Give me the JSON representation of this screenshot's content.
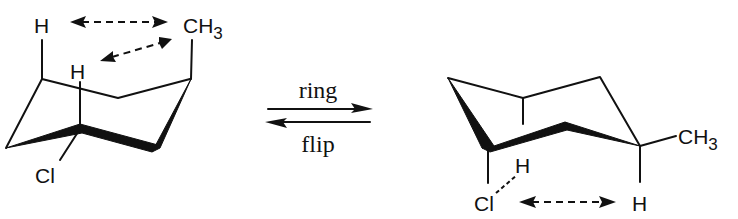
{
  "diagram": {
    "type": "chair-conformation-ring-flip",
    "left_chair": {
      "labels": {
        "h_top": "H",
        "h_axial": "H",
        "methyl": "CH",
        "methyl_sub": "3",
        "chloro": "Cl"
      },
      "interactions": [
        "H ↔ CH3 (1,3-diaxial)",
        "H ↔ CH3 (1,3-diaxial)"
      ]
    },
    "equilibrium": {
      "label_top": "ring",
      "label_bottom": "flip"
    },
    "right_chair": {
      "labels": {
        "methyl": "CH",
        "methyl_sub": "3",
        "chloro": "Cl",
        "h_near_cl": "H",
        "h_axial": "H"
      },
      "interactions": [
        "Cl ↔ H (1,3-diaxial)"
      ]
    },
    "colors": {
      "ink": "#111111",
      "background": "#ffffff"
    }
  }
}
